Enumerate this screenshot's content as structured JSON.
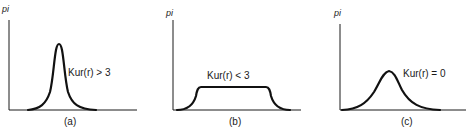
{
  "panels": [
    {
      "id": "a",
      "ylabel": "pi",
      "annotation": "Kur(r) > 3",
      "caption": "(a)",
      "shape": "leptokurtic"
    },
    {
      "id": "b",
      "ylabel": "pi",
      "annotation": "Kur(r) < 3",
      "caption": "(b)",
      "shape": "platykurtic"
    },
    {
      "id": "c",
      "ylabel": "pi",
      "annotation": "Kur(r) = 0",
      "caption": "(c)",
      "shape": "mesokurtic"
    }
  ],
  "colors": {
    "line": "#111111",
    "background": "#ffffff"
  }
}
